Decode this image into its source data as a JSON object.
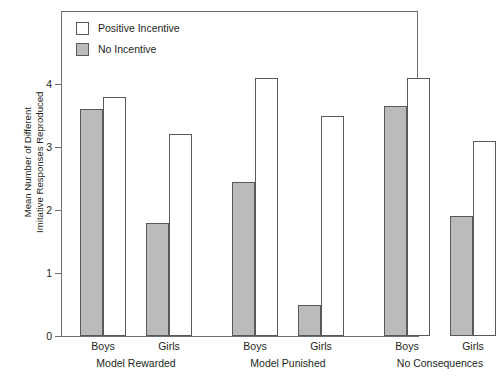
{
  "chart_data": {
    "type": "bar",
    "title": "",
    "subtitle": "",
    "xlabel": "",
    "ylabel": "Mean Number of Different\nImitative Responses Reproduced",
    "ylim": [
      0,
      4.5
    ],
    "yticks": [
      0,
      1,
      2,
      3,
      4
    ],
    "ytick_labels": [
      "0",
      "1",
      "2",
      "3",
      "4"
    ],
    "grid": false,
    "legend_position": "top-left",
    "categories": [
      "Boys",
      "Girls",
      "Boys",
      "Girls",
      "Boys",
      "Girls"
    ],
    "groups": [
      {
        "label": "Model Rewarded",
        "subcategories": [
          "Boys",
          "Girls"
        ]
      },
      {
        "label": "Model Punished",
        "subcategories": [
          "Boys",
          "Girls"
        ]
      },
      {
        "label": "No Consequences",
        "subcategories": [
          "Boys",
          "Girls"
        ]
      }
    ],
    "series": [
      {
        "name": "No Incentive",
        "color": "#b9bbbd",
        "values": [
          3.6,
          1.8,
          2.45,
          0.5,
          3.65,
          1.9
        ]
      },
      {
        "name": "Positive Incentive",
        "color": "#ffffff",
        "values": [
          3.8,
          3.2,
          4.1,
          3.5,
          4.1,
          3.1
        ]
      }
    ],
    "bars": [
      {
        "group": "Model Rewarded",
        "subcategory": "Boys",
        "series": "No Incentive",
        "value": 3.6
      },
      {
        "group": "Model Rewarded",
        "subcategory": "Boys",
        "series": "Positive Incentive",
        "value": 3.8
      },
      {
        "group": "Model Rewarded",
        "subcategory": "Girls",
        "series": "No Incentive",
        "value": 1.8
      },
      {
        "group": "Model Rewarded",
        "subcategory": "Girls",
        "series": "Positive Incentive",
        "value": 3.2
      },
      {
        "group": "Model Punished",
        "subcategory": "Boys",
        "series": "No Incentive",
        "value": 2.45
      },
      {
        "group": "Model Punished",
        "subcategory": "Boys",
        "series": "Positive Incentive",
        "value": 4.1
      },
      {
        "group": "Model Punished",
        "subcategory": "Girls",
        "series": "No Incentive",
        "value": 0.5
      },
      {
        "group": "Model Punished",
        "subcategory": "Girls",
        "series": "Positive Incentive",
        "value": 3.5
      },
      {
        "group": "No Consequences",
        "subcategory": "Boys",
        "series": "No Incentive",
        "value": 3.65
      },
      {
        "group": "No Consequences",
        "subcategory": "Boys",
        "series": "Positive Incentive",
        "value": 4.1
      },
      {
        "group": "No Consequences",
        "subcategory": "Girls",
        "series": "No Incentive",
        "value": 1.9
      },
      {
        "group": "No Consequences",
        "subcategory": "Girls",
        "series": "Positive Incentive",
        "value": 3.1
      }
    ]
  },
  "legend": {
    "items": [
      {
        "label": "Positive Incentive",
        "swatch": "#ffffff"
      },
      {
        "label": "No Incentive",
        "swatch": "#b9bbbd"
      }
    ]
  },
  "axis": {
    "y_title": "Mean Number of Different\nImitative Responses Reproduced",
    "y_tick_labels": [
      "4",
      "3",
      "2",
      "1",
      "0"
    ]
  },
  "x_axis": {
    "sub_labels": [
      "Boys",
      "Girls",
      "Boys",
      "Girls",
      "Boys",
      "Girls"
    ],
    "group_labels": [
      "Model Rewarded",
      "Model Punished",
      "No Consequences"
    ]
  },
  "colors": {
    "bar_fill_gray": "#b9bbbd",
    "bar_fill_white": "#ffffff",
    "bar_stroke": "#58595b",
    "axis": "#6d6e71",
    "text": "#231f20",
    "background": "#ffffff"
  }
}
